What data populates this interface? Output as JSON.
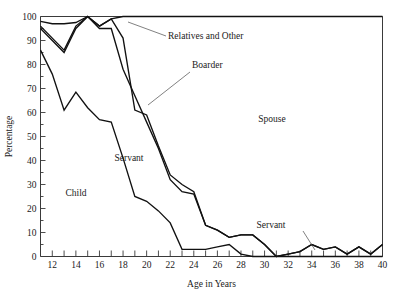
{
  "chart_data": {
    "type": "line",
    "title": "",
    "xlabel": "Age in Years",
    "ylabel": "Percentage",
    "xlim": [
      11,
      40
    ],
    "ylim": [
      0,
      100
    ],
    "grid": false,
    "legend": "in-plot-labels",
    "x_major_ticks": [
      12,
      14,
      16,
      18,
      20,
      22,
      24,
      26,
      28,
      30,
      32,
      34,
      36,
      38,
      40
    ],
    "x_minor_ticks": [
      11,
      13,
      15,
      17,
      19,
      21,
      23,
      25,
      27,
      29,
      31,
      33,
      35,
      37,
      39
    ],
    "y_major_ticks": [
      0,
      10,
      20,
      30,
      40,
      50,
      60,
      70,
      80,
      90,
      100
    ],
    "y_minor_ticks": [
      5,
      15,
      25,
      35,
      45,
      55,
      65,
      75,
      85,
      95
    ],
    "x": [
      11,
      12,
      13,
      14,
      15,
      16,
      17,
      18,
      19,
      20,
      21,
      22,
      23,
      24,
      25,
      26,
      27,
      28,
      29,
      30,
      31,
      32,
      33,
      34,
      35,
      36,
      37,
      38,
      39,
      40
    ],
    "series": [
      {
        "name": "Child upper boundary",
        "label": "Child",
        "values": [
          86,
          76,
          61,
          68.5,
          62,
          57,
          56,
          41,
          25,
          23,
          19,
          14,
          3,
          3,
          3,
          4,
          5,
          1,
          0,
          0,
          0,
          0,
          0,
          0,
          0,
          0,
          0,
          0,
          0,
          0
        ]
      },
      {
        "name": "Servant upper boundary",
        "label": "Servant",
        "values": [
          95,
          90,
          85,
          95,
          100,
          95,
          95,
          78,
          67,
          56,
          45,
          32,
          27,
          26,
          13,
          11,
          8,
          9,
          9,
          5,
          0,
          1,
          2,
          5,
          3,
          4,
          1,
          4,
          1,
          5
        ]
      },
      {
        "name": "Boarder upper boundary",
        "label": "Boarder",
        "values": [
          96,
          91,
          86,
          96,
          100,
          96,
          99,
          91,
          61,
          59,
          46,
          34,
          30,
          27,
          13,
          11,
          8,
          9,
          9,
          5,
          0,
          1,
          2,
          5,
          3,
          4,
          1,
          4,
          1,
          5
        ]
      },
      {
        "name": "Relatives and Other upper boundary",
        "label": "Relatives and Other",
        "values": [
          98,
          97,
          97,
          97.5,
          100,
          96,
          99,
          100,
          100,
          100,
          100,
          100,
          100,
          100,
          100,
          100,
          100,
          100,
          100,
          100,
          100,
          100,
          100,
          100,
          100,
          100,
          100,
          100,
          100,
          100
        ]
      },
      {
        "name": "Spouse upper boundary (100% frame)",
        "label": "Spouse",
        "values": [
          100,
          100,
          100,
          100,
          100,
          100,
          100,
          100,
          100,
          100,
          100,
          100,
          100,
          100,
          100,
          100,
          100,
          100,
          100,
          100,
          100,
          100,
          100,
          100,
          100,
          100,
          100,
          100,
          100,
          100
        ]
      }
    ],
    "annotations": [
      {
        "text": "Relatives and Other",
        "x_px": 168,
        "y_px": 39
      },
      {
        "text": "Boarder",
        "x_px": 192,
        "y_px": 68
      },
      {
        "text": "Servant",
        "x_px": 129,
        "y_px": 161
      },
      {
        "text": "Child",
        "x_px": 76,
        "y_px": 196
      },
      {
        "text": "Spouse",
        "x_px": 272,
        "y_px": 122
      },
      {
        "text": "Servant",
        "x_px": 271,
        "y_px": 228
      }
    ]
  }
}
